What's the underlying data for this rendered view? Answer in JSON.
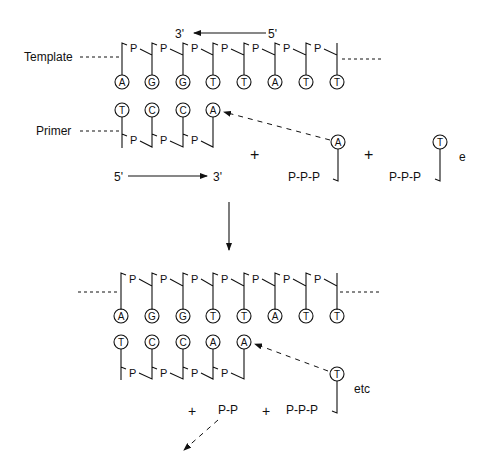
{
  "diagram": {
    "top": {
      "template_label": "Template",
      "primer_label": "Primer",
      "template_direction": {
        "from": "5'",
        "to": "3'"
      },
      "primer_direction": {
        "from": "5'",
        "to": "3'"
      },
      "template_bases": [
        "A",
        "G",
        "G",
        "T",
        "T",
        "A",
        "T",
        "T"
      ],
      "primer_bases": [
        "T",
        "C",
        "C",
        "A"
      ],
      "backbone_label": "P",
      "incoming": [
        {
          "base": "A",
          "phosphates": "P-P-P"
        },
        {
          "base": "T",
          "phosphates": "P-P-P"
        }
      ],
      "plus": "+",
      "trailing_text": "e"
    },
    "bottom": {
      "template_bases": [
        "A",
        "G",
        "G",
        "T",
        "T",
        "A",
        "T",
        "T"
      ],
      "primer_bases": [
        "T",
        "C",
        "C",
        "A",
        "A"
      ],
      "backbone_label": "P",
      "incoming": {
        "base": "T",
        "phosphates": "P-P-P"
      },
      "released": "P-P",
      "plus": "+",
      "trailing_text": "etc"
    }
  }
}
